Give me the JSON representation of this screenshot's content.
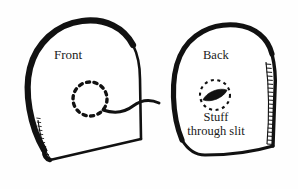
{
  "diagram": {
    "background_color": "#fefefe",
    "ink_color": "#111111",
    "labels": {
      "front": "Front",
      "back": "Back",
      "stuff_line1": "Stuff",
      "stuff_line2": "through slit"
    },
    "shapes": {
      "front_mitten": "mitten-outline-front",
      "back_mitten": "mitten-outline-back",
      "front_slit_marker": "dashed-circle-front",
      "back_slit_marker": "dashed-circle-back",
      "slit_opening": "lens-shaped-slit",
      "connector": "curved-pointer-line",
      "front_cuff": "hatched-cuff-front",
      "back_cuff": "hatched-cuff-back"
    }
  }
}
